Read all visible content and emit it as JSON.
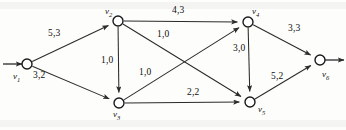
{
  "figure": {
    "kind": "flow-network-diagram",
    "width": 346,
    "height": 130,
    "edge_label_format": "capacity,flow"
  },
  "nodes": [
    {
      "id": "v1",
      "label": "v",
      "sub": "1",
      "x": 27,
      "y": 64,
      "r": 5.0,
      "label_x": 13,
      "label_y": 72
    },
    {
      "id": "v2",
      "label": "v",
      "sub": "2",
      "x": 118,
      "y": 21,
      "r": 5.0,
      "label_x": 105,
      "label_y": 7
    },
    {
      "id": "v3",
      "label": "v",
      "sub": "3",
      "x": 119,
      "y": 103,
      "r": 5.0,
      "label_x": 113,
      "label_y": 110
    },
    {
      "id": "v4",
      "label": "v",
      "sub": "4",
      "x": 248,
      "y": 22,
      "r": 5.0,
      "label_x": 252,
      "label_y": 7
    },
    {
      "id": "v5",
      "label": "v",
      "sub": "5",
      "x": 250,
      "y": 102,
      "r": 5.0,
      "label_x": 258,
      "label_y": 105
    },
    {
      "id": "v6",
      "label": "v",
      "sub": "6",
      "x": 320,
      "y": 60,
      "r": 5.0,
      "label_x": 322,
      "label_y": 70
    }
  ],
  "edges": [
    {
      "from": "v1",
      "to": "v2",
      "capacity": 5,
      "flow": 3,
      "label": "5,3",
      "label_x": 48,
      "label_y": 29
    },
    {
      "from": "v1",
      "to": "v3",
      "capacity": 3,
      "flow": 2,
      "label": "3,2",
      "label_x": 33,
      "label_y": 71
    },
    {
      "from": "v2",
      "to": "v4",
      "capacity": 4,
      "flow": 3,
      "label": "4,3",
      "label_x": 172,
      "label_y": 6
    },
    {
      "from": "v2",
      "to": "v3",
      "capacity": 1,
      "flow": 0,
      "label": "1,0",
      "label_x": 101,
      "label_y": 56
    },
    {
      "from": "v2",
      "to": "v5",
      "capacity": 1,
      "flow": 0,
      "label": "1,0",
      "label_x": 157,
      "label_y": 30
    },
    {
      "from": "v3",
      "to": "v4",
      "capacity": 1,
      "flow": 0,
      "label": "1,0",
      "label_x": 139,
      "label_y": 68
    },
    {
      "from": "v3",
      "to": "v5",
      "capacity": 2,
      "flow": 2,
      "label": "2,2",
      "label_x": 187,
      "label_y": 88
    },
    {
      "from": "v4",
      "to": "v5",
      "capacity": 3,
      "flow": 0,
      "label": "3,0",
      "label_x": 233,
      "label_y": 44
    },
    {
      "from": "v4",
      "to": "v6",
      "capacity": 3,
      "flow": 3,
      "label": "3,3",
      "label_x": 288,
      "label_y": 24
    },
    {
      "from": "v5",
      "to": "v6",
      "capacity": 5,
      "flow": 2,
      "label": "5,2",
      "label_x": 271,
      "label_y": 72
    }
  ],
  "terminals": {
    "source_arrow": {
      "from_x": 3,
      "from_y": 64,
      "to_x": 22,
      "to_y": 64
    },
    "sink_arrow": {
      "from_x": 325,
      "from_y": 60,
      "to_x": 344,
      "to_y": 60
    }
  }
}
